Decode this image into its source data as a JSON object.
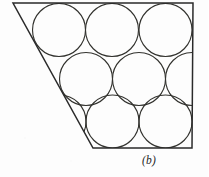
{
  "figure": {
    "caption": "(b)",
    "caption_position": {
      "x": 142,
      "y": 154
    },
    "canvas": {
      "width": 208,
      "height": 177
    },
    "background_color": "#fdfdfd",
    "boundary": {
      "name": "trapezoid-boundary",
      "stroke_color": "#2a2a2a",
      "stroke_width": 1.5,
      "vertices": [
        {
          "label": "top-left",
          "x": 13,
          "y": 3
        },
        {
          "label": "top-right",
          "x": 193,
          "y": 3
        },
        {
          "label": "bottom-right",
          "x": 192,
          "y": 148
        },
        {
          "label": "bottom-left",
          "x": 93,
          "y": 148
        }
      ],
      "path": "M 13 3 L 193 3 L 192 148 L 93 148 Z"
    },
    "circles": {
      "stroke_color": "#33332f",
      "stroke_width": 1.15,
      "radius": 26.5,
      "count": 9,
      "rows": [
        {
          "row_label": "top-row",
          "cy": 30,
          "items": [
            {
              "id": "circle-r1-c1",
              "cx": 59,
              "cy": 30,
              "r": 26.5
            },
            {
              "id": "circle-r1-c2",
              "cx": 112,
              "cy": 30,
              "r": 26.5
            },
            {
              "id": "circle-r1-c3",
              "cx": 165.5,
              "cy": 30,
              "r": 26.5
            }
          ]
        },
        {
          "row_label": "middle-row",
          "cy": 79,
          "items": [
            {
              "id": "circle-r2-c1",
              "cx": 86,
              "cy": 79,
              "r": 26.5
            },
            {
              "id": "circle-r2-c2",
              "cx": 139,
              "cy": 79,
              "r": 26.5
            },
            {
              "id": "circle-r2-c3",
              "cx": 192,
              "cy": 79,
              "r": 26.5
            }
          ]
        },
        {
          "row_label": "bottom-row",
          "cy": 121.5,
          "items": [
            {
              "id": "circle-r3-c1",
              "cx": 112.5,
              "cy": 121.5,
              "r": 26.5
            },
            {
              "id": "circle-r3-c2",
              "cx": 165.5,
              "cy": 121.5,
              "r": 26.5
            },
            {
              "id": "circle-r3-c3",
              "cx": 59.5,
              "cy": 121.5,
              "r": 26.5
            }
          ]
        }
      ]
    }
  }
}
